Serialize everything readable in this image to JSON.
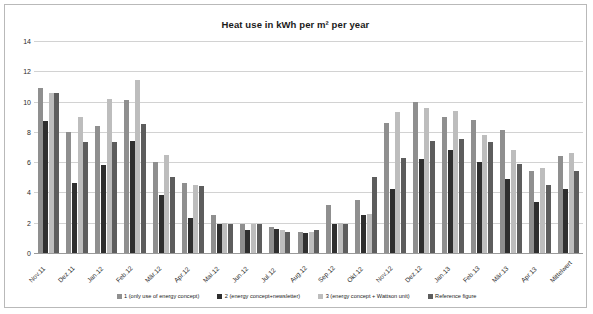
{
  "chart_data": {
    "type": "bar",
    "title": "Heat use in kWh per m² per year",
    "xlabel": "",
    "ylabel": "",
    "ylim": [
      0,
      14
    ],
    "yticks": [
      0,
      2,
      4,
      6,
      8,
      10,
      12,
      14
    ],
    "grid": true,
    "legend_position": "bottom",
    "categories": [
      "Nov.11",
      "Dez.11",
      "Jan.12",
      "Feb.12",
      "Mär.12",
      "Apr.12",
      "Mai.12",
      "Jun.12",
      "Jul.12",
      "Aug.12",
      "Sep.12",
      "Okt.12",
      "Nov.12",
      "Dez.12",
      "Jan.13",
      "Feb.13",
      "Mär.13",
      "Apr.13",
      "Mittelwert"
    ],
    "series": [
      {
        "name": "1 (only use of energy concept)",
        "color": "#8f8f8f",
        "values": [
          10.9,
          8.0,
          8.4,
          10.1,
          6.0,
          4.6,
          2.5,
          1.9,
          1.7,
          1.4,
          3.2,
          3.5,
          8.6,
          10.0,
          9.0,
          8.8,
          8.1,
          5.4,
          6.4
        ]
      },
      {
        "name": "2 (energy concept+newsletter)",
        "color": "#2f2f2f",
        "values": [
          8.7,
          4.6,
          5.8,
          7.4,
          3.8,
          2.3,
          1.9,
          1.5,
          1.6,
          1.3,
          1.9,
          2.5,
          4.2,
          6.2,
          6.8,
          6.0,
          4.9,
          3.4,
          4.2
        ]
      },
      {
        "name": "3 (energy concept + Wattson unit)",
        "color": "#bdbdbd",
        "values": [
          10.6,
          9.0,
          10.2,
          11.4,
          6.5,
          4.5,
          2.0,
          1.9,
          1.5,
          1.4,
          2.0,
          2.6,
          9.3,
          9.6,
          9.4,
          7.8,
          6.8,
          5.6,
          6.6
        ]
      },
      {
        "name": "Reference figure",
        "color": "#5d5d5d",
        "values": [
          10.6,
          7.3,
          7.3,
          8.5,
          5.0,
          4.4,
          1.9,
          1.9,
          1.4,
          1.5,
          1.9,
          5.0,
          6.3,
          7.4,
          7.5,
          7.3,
          5.9,
          4.5,
          5.4
        ]
      }
    ]
  },
  "legend": {
    "items": [
      {
        "label": "1 (only use of energy concept)",
        "color": "#8f8f8f"
      },
      {
        "label": "2 (energy concept+newsletter)",
        "color": "#2f2f2f"
      },
      {
        "label": "3 (energy concept + Wattson unit)",
        "color": "#bdbdbd"
      },
      {
        "label": "Reference figure",
        "color": "#5d5d5d"
      }
    ]
  }
}
